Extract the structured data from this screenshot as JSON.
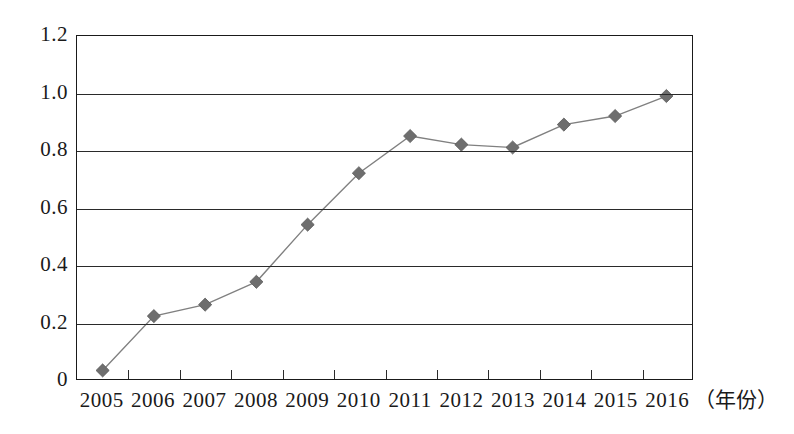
{
  "chart_data": {
    "type": "line",
    "title": "",
    "subtitle": "",
    "xlabel": "（年份）",
    "ylabel": "",
    "categories": [
      "2005",
      "2006",
      "2007",
      "2008",
      "2009",
      "2010",
      "2011",
      "2012",
      "2013",
      "2014",
      "2015",
      "2016"
    ],
    "series": [
      {
        "name": "",
        "values": [
          0.03,
          0.22,
          0.26,
          0.34,
          0.54,
          0.72,
          0.85,
          0.82,
          0.81,
          0.89,
          0.92,
          0.99
        ]
      }
    ],
    "ylim": [
      0,
      1.2
    ],
    "ytick_labels": [
      "1.2",
      "1.0",
      "0.8",
      "0.6",
      "0.4",
      "0.2",
      "0"
    ],
    "ytick_values": [
      1.2,
      1.0,
      0.8,
      0.6,
      0.4,
      0.2,
      0
    ],
    "grid": "horizontal",
    "legend": "none",
    "marker": "diamond",
    "marker_color": "#6e6e6e",
    "line_color": "#808080",
    "axis_color": "#1a1a1a",
    "background_color": "#ffffff"
  }
}
